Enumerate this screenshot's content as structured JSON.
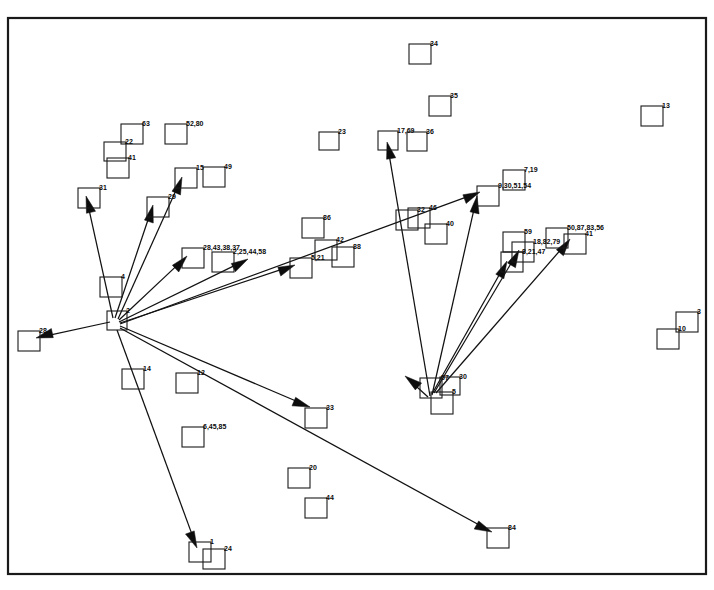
{
  "figure": {
    "title": "",
    "type": "node-link-diagram",
    "background": "#ffffff",
    "stroke_color": "#111111",
    "frame": {
      "x": 8,
      "y": 18,
      "width": 698,
      "height": 556
    }
  },
  "nodes": [
    {
      "id": "n34",
      "label": "34",
      "x": 409,
      "y": 44,
      "w": 22,
      "h": 20
    },
    {
      "id": "n35",
      "label": "35",
      "x": 429,
      "y": 96,
      "w": 22,
      "h": 20
    },
    {
      "id": "n13",
      "label": "13",
      "x": 641,
      "y": 106,
      "w": 22,
      "h": 20
    },
    {
      "id": "n63",
      "label": "63",
      "x": 121,
      "y": 124,
      "w": 22,
      "h": 20
    },
    {
      "id": "n5280",
      "label": "52,80",
      "x": 165,
      "y": 124,
      "w": 22,
      "h": 20
    },
    {
      "id": "n23",
      "label": "23",
      "x": 319,
      "y": 132,
      "w": 20,
      "h": 18
    },
    {
      "id": "n1769",
      "label": "17,69",
      "x": 378,
      "y": 131,
      "w": 20,
      "h": 19
    },
    {
      "id": "n36",
      "label": "36",
      "x": 407,
      "y": 132,
      "w": 20,
      "h": 19
    },
    {
      "id": "n22",
      "label": "22",
      "x": 104,
      "y": 142,
      "w": 22,
      "h": 19
    },
    {
      "id": "n41b",
      "label": "41",
      "x": 107,
      "y": 158,
      "w": 22,
      "h": 20
    },
    {
      "id": "n15",
      "label": "15",
      "x": 175,
      "y": 168,
      "w": 22,
      "h": 20
    },
    {
      "id": "n49",
      "label": "49",
      "x": 203,
      "y": 167,
      "w": 22,
      "h": 20
    },
    {
      "id": "n719",
      "label": "7,19",
      "x": 503,
      "y": 170,
      "w": 22,
      "h": 20
    },
    {
      "id": "n31",
      "label": "31",
      "x": 78,
      "y": 188,
      "w": 22,
      "h": 20
    },
    {
      "id": "n93051",
      "label": "9,30,51,54",
      "x": 477,
      "y": 186,
      "w": 22,
      "h": 20
    },
    {
      "id": "n29",
      "label": "29",
      "x": 147,
      "y": 197,
      "w": 22,
      "h": 20
    },
    {
      "id": "n32",
      "label": "32",
      "x": 396,
      "y": 210,
      "w": 22,
      "h": 20
    },
    {
      "id": "n46",
      "label": "46",
      "x": 408,
      "y": 208,
      "w": 22,
      "h": 20
    },
    {
      "id": "n86",
      "label": "86",
      "x": 302,
      "y": 218,
      "w": 22,
      "h": 20
    },
    {
      "id": "n40",
      "label": "40",
      "x": 425,
      "y": 224,
      "w": 22,
      "h": 20
    },
    {
      "id": "n508783",
      "label": "50,87,83,56",
      "x": 546,
      "y": 228,
      "w": 22,
      "h": 20
    },
    {
      "id": "n59",
      "label": "59",
      "x": 503,
      "y": 232,
      "w": 22,
      "h": 20
    },
    {
      "id": "n41",
      "label": "41",
      "x": 564,
      "y": 234,
      "w": 22,
      "h": 20
    },
    {
      "id": "n42",
      "label": "42",
      "x": 315,
      "y": 240,
      "w": 22,
      "h": 20
    },
    {
      "id": "n1882",
      "label": "18,82,79",
      "x": 512,
      "y": 242,
      "w": 22,
      "h": 20
    },
    {
      "id": "n88",
      "label": "88",
      "x": 332,
      "y": 247,
      "w": 22,
      "h": 20
    },
    {
      "id": "n28433837",
      "label": "28,43,38,37",
      "x": 182,
      "y": 248,
      "w": 22,
      "h": 20
    },
    {
      "id": "n2254458",
      "label": "2,25,44,58",
      "x": 212,
      "y": 252,
      "w": 22,
      "h": 20
    },
    {
      "id": "n82147",
      "label": "8,21,47",
      "x": 501,
      "y": 252,
      "w": 22,
      "h": 20
    },
    {
      "id": "n521",
      "label": "5,21",
      "x": 290,
      "y": 258,
      "w": 22,
      "h": 20
    },
    {
      "id": "n4",
      "label": "4",
      "x": 100,
      "y": 277,
      "w": 22,
      "h": 20
    },
    {
      "id": "n3",
      "label": "3",
      "x": 676,
      "y": 312,
      "w": 22,
      "h": 20
    },
    {
      "id": "n2",
      "label": "2",
      "x": 107,
      "y": 311,
      "w": 20,
      "h": 19
    },
    {
      "id": "n28",
      "label": "28",
      "x": 18,
      "y": 331,
      "w": 22,
      "h": 20
    },
    {
      "id": "n10",
      "label": "10",
      "x": 657,
      "y": 329,
      "w": 22,
      "h": 20
    },
    {
      "id": "n14",
      "label": "14",
      "x": 122,
      "y": 369,
      "w": 22,
      "h": 20
    },
    {
      "id": "n12",
      "label": "12",
      "x": 176,
      "y": 373,
      "w": 22,
      "h": 20
    },
    {
      "id": "n57",
      "label": "57",
      "x": 420,
      "y": 378,
      "w": 22,
      "h": 20
    },
    {
      "id": "n30",
      "label": "30",
      "x": 440,
      "y": 377,
      "w": 20,
      "h": 18
    },
    {
      "id": "n5",
      "label": "5",
      "x": 431,
      "y": 392,
      "w": 22,
      "h": 22
    },
    {
      "id": "n33",
      "label": "33",
      "x": 305,
      "y": 408,
      "w": 22,
      "h": 20
    },
    {
      "id": "n64585",
      "label": "6,45,85",
      "x": 182,
      "y": 427,
      "w": 22,
      "h": 20
    },
    {
      "id": "n20",
      "label": "20",
      "x": 288,
      "y": 468,
      "w": 22,
      "h": 20
    },
    {
      "id": "n44",
      "label": "44",
      "x": 305,
      "y": 498,
      "w": 22,
      "h": 20
    },
    {
      "id": "n84",
      "label": "84",
      "x": 487,
      "y": 528,
      "w": 22,
      "h": 20
    },
    {
      "id": "n1",
      "label": "1",
      "x": 189,
      "y": 542,
      "w": 22,
      "h": 20
    },
    {
      "id": "n24",
      "label": "24",
      "x": 203,
      "y": 549,
      "w": 22,
      "h": 20
    }
  ],
  "edges": [
    {
      "id": "e1",
      "from": "2",
      "to": "28",
      "x1": 110,
      "y1": 322,
      "x2": 36,
      "y2": 338
    },
    {
      "id": "e2",
      "from": "2",
      "to": "31",
      "x1": 113,
      "y1": 318,
      "x2": 86,
      "y2": 196
    },
    {
      "id": "e3",
      "from": "2",
      "to": "29",
      "x1": 115,
      "y1": 318,
      "x2": 153,
      "y2": 205
    },
    {
      "id": "e4",
      "from": "2",
      "to": "15",
      "x1": 118,
      "y1": 319,
      "x2": 182,
      "y2": 177
    },
    {
      "id": "e5",
      "from": "2",
      "to": "28,43,38,37",
      "x1": 119,
      "y1": 320,
      "x2": 187,
      "y2": 256
    },
    {
      "id": "e6",
      "from": "2",
      "to": "2,25,44,58",
      "x1": 119,
      "y1": 322,
      "x2": 248,
      "y2": 259
    },
    {
      "id": "e7",
      "from": "2",
      "to": "5,21",
      "x1": 120,
      "y1": 323,
      "x2": 295,
      "y2": 265
    },
    {
      "id": "e8",
      "from": "2",
      "to": "9,30,51,54",
      "x1": 120,
      "y1": 324,
      "x2": 480,
      "y2": 192
    },
    {
      "id": "e9",
      "from": "2",
      "to": "33",
      "x1": 120,
      "y1": 326,
      "x2": 310,
      "y2": 407
    },
    {
      "id": "e10",
      "from": "2",
      "to": "84",
      "x1": 120,
      "y1": 328,
      "x2": 492,
      "y2": 532
    },
    {
      "id": "e11",
      "from": "2",
      "to": "1",
      "x1": 117,
      "y1": 330,
      "x2": 197,
      "y2": 548
    },
    {
      "id": "e12",
      "from": "5",
      "to": "17,69",
      "x1": 430,
      "y1": 396,
      "x2": 387,
      "y2": 142
    },
    {
      "id": "e13",
      "from": "5",
      "to": "9,30,51,54",
      "x1": 432,
      "y1": 395,
      "x2": 477,
      "y2": 196
    },
    {
      "id": "e14",
      "from": "5",
      "to": "8,21,47",
      "x1": 432,
      "y1": 394,
      "x2": 507,
      "y2": 261
    },
    {
      "id": "e15",
      "from": "5",
      "to": "18,82,79",
      "x1": 434,
      "y1": 393,
      "x2": 519,
      "y2": 250
    },
    {
      "id": "e16",
      "from": "5",
      "to": "41",
      "x1": 436,
      "y1": 393,
      "x2": 570,
      "y2": 239
    },
    {
      "id": "e17",
      "from": "5",
      "to": "57-left",
      "x1": 428,
      "y1": 397,
      "x2": 405,
      "y2": 376
    }
  ],
  "meta": {
    "node_count": 47,
    "edge_count": 17,
    "hub_nodes": [
      "2",
      "5"
    ]
  }
}
